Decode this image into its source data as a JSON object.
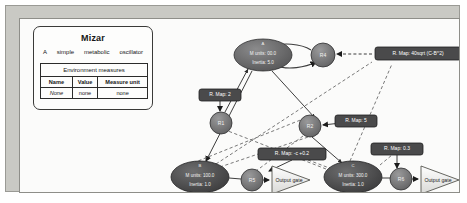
{
  "window": {
    "frame_color": "#c9c9c4",
    "canvas_color": "#fbfbfa"
  },
  "info_panel": {
    "title": "Mizar",
    "subtitle_words": [
      "A",
      "simple",
      "metabolic",
      "oscillator"
    ],
    "table": {
      "caption": "Environment measures",
      "headers": [
        "Name",
        "Value",
        "Measure unit"
      ],
      "rows": [
        [
          "None",
          "none",
          "none"
        ]
      ]
    }
  },
  "diagram": {
    "type": "node-link-graph",
    "nodes": [
      {
        "id": "A",
        "shape": "ellipse",
        "title": "A",
        "line1": "M units: 00.0",
        "line2": "Inertia: 5.0",
        "cx": 243,
        "cy": 36,
        "rx": 29,
        "ry": 16,
        "fill": "#6f6f70"
      },
      {
        "id": "B",
        "shape": "ellipse",
        "title": "B",
        "line1": "M units: 100.0",
        "line2": "Inertia: 1.0",
        "cx": 180,
        "cy": 158,
        "rx": 29,
        "ry": 16,
        "fill": "#4f4f50"
      },
      {
        "id": "C",
        "shape": "ellipse",
        "title": "C",
        "line1": "M units: 300.0",
        "line2": "Inertia: 1.0",
        "cx": 333,
        "cy": 158,
        "rx": 29,
        "ry": 16,
        "fill": "#4f4f50"
      },
      {
        "id": "R1",
        "shape": "circle",
        "title": "R1",
        "cx": 201,
        "cy": 104,
        "r": 11,
        "fill": "#777778"
      },
      {
        "id": "R2",
        "shape": "circle",
        "title": "R2",
        "cx": 290,
        "cy": 107,
        "r": 11,
        "fill": "#777778"
      },
      {
        "id": "R4",
        "shape": "circle",
        "title": "R4",
        "cx": 303,
        "cy": 36,
        "r": 12,
        "fill": "#777778"
      },
      {
        "id": "R5",
        "shape": "circle",
        "title": "R5",
        "cx": 232,
        "cy": 161,
        "r": 11,
        "fill": "#777778"
      },
      {
        "id": "R6",
        "shape": "circle",
        "title": "R6",
        "cx": 381,
        "cy": 160,
        "r": 11,
        "fill": "#777778"
      }
    ],
    "gates": [
      {
        "id": "gate-b",
        "label": "Output gate",
        "x": 258,
        "y": 161
      },
      {
        "id": "gate-c",
        "label": "Output gate",
        "x": 407,
        "y": 161
      }
    ],
    "map_labels": [
      {
        "id": "map-r4",
        "text": "R. Map: 40sqrt (C-B^2)",
        "x": 398,
        "y": 35
      },
      {
        "id": "map-r1",
        "text": "R. Map: 2",
        "x": 200,
        "y": 76
      },
      {
        "id": "map-r2",
        "text": "R. Map: 5",
        "x": 336,
        "y": 102
      },
      {
        "id": "map-r5",
        "text": "R. Map: -c +0.2",
        "x": 272,
        "y": 135
      },
      {
        "id": "map-r6",
        "text": "R. Map: 0.3",
        "x": 377,
        "y": 130
      }
    ],
    "colors": {
      "node_dark": "#4f4f50",
      "node_mid": "#6f6f70",
      "node_light": "#777778",
      "label_box": "#4a4a4b",
      "edge": "#3d3d3d"
    }
  }
}
